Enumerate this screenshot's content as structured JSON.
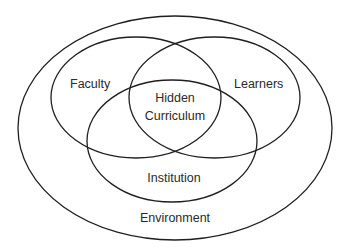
{
  "diagram": {
    "type": "nested-venn",
    "stroke_color": "#1f1f1f",
    "text_color": "#2a2a2a",
    "background": "#ffffff",
    "shapes": [
      {
        "id": "environment",
        "label": "Environment",
        "cx": 175,
        "cy": 128,
        "rx": 157,
        "ry": 112
      },
      {
        "id": "faculty",
        "label": "Faculty",
        "cx": 136,
        "cy": 97.5,
        "rx": 85,
        "ry": 60.5
      },
      {
        "id": "learners",
        "label": "Learners",
        "cx": 214.5,
        "cy": 97.5,
        "rx": 85.5,
        "ry": 60.5
      },
      {
        "id": "institution",
        "label": "Institution",
        "cx": 172,
        "cy": 141,
        "rx": 85,
        "ry": 61
      }
    ],
    "labels": {
      "faculty": "Faculty",
      "learners": "Learners",
      "center_line1": "Hidden",
      "center_line2": "Curriculum",
      "institution": "Institution",
      "environment": "Environment"
    }
  }
}
